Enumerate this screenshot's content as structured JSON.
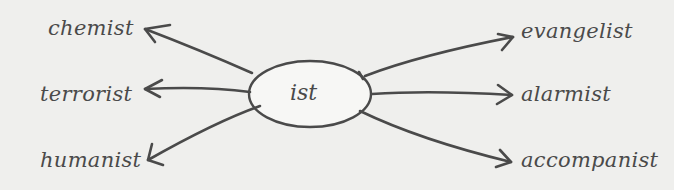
{
  "diagram": {
    "center": {
      "label": "ist"
    },
    "left_words": [
      {
        "label": "chemist"
      },
      {
        "label": "terrorist"
      },
      {
        "label": "humanist"
      }
    ],
    "right_words": [
      {
        "label": "evangelist"
      },
      {
        "label": "alarmist"
      },
      {
        "label": "accompanist"
      }
    ],
    "colors": {
      "background": "#efefed",
      "stroke": "#4a4a4a",
      "ellipse_fill": "#f7f7f5"
    }
  }
}
